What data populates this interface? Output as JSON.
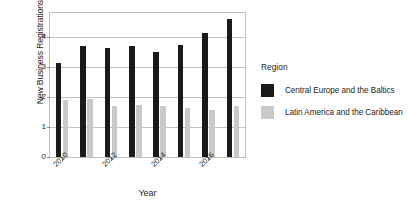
{
  "chart_data": {
    "type": "bar",
    "title": "",
    "xlabel": "Year",
    "ylabel": "New Business Registrations,\nper 1,000 persons",
    "categories": [
      "2010",
      "2011",
      "2012",
      "2013",
      "2014",
      "2015",
      "2016",
      "2017"
    ],
    "xtick_labels": [
      "2010",
      "2012",
      "2014",
      "2016"
    ],
    "ytick_labels": [
      "0",
      "1",
      "2",
      "3",
      "4"
    ],
    "ylim": [
      0,
      4.8
    ],
    "yticks": [
      0,
      1,
      2,
      3,
      4
    ],
    "grid": true,
    "legend_position": "right",
    "series": [
      {
        "name": "Central Europe and the Baltics",
        "color": "#1a1a1a",
        "values": [
          3.12,
          3.7,
          3.62,
          3.71,
          3.5,
          3.75,
          4.15,
          4.6
        ]
      },
      {
        "name": "Latin America and the Caribbean",
        "color": "#c9c9c9",
        "values": [
          1.9,
          1.94,
          1.7,
          1.75,
          1.71,
          1.62,
          1.56,
          1.69
        ]
      }
    ]
  },
  "legend": {
    "title": "Region",
    "entries": [
      {
        "label": "Central Europe and the Baltics",
        "swatch": "dark"
      },
      {
        "label": "Latin America and the Caribbean",
        "swatch": "light"
      }
    ]
  }
}
